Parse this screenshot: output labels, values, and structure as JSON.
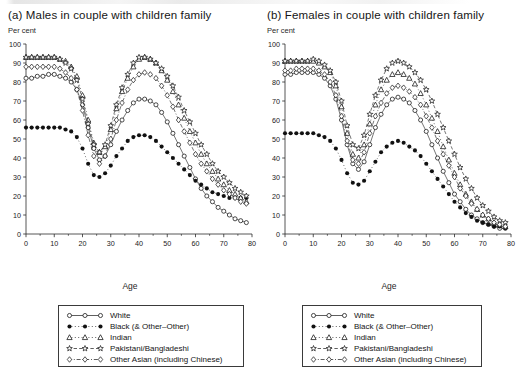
{
  "panels": [
    {
      "key": "a",
      "title": "(a) Males in couple with children family",
      "axis_unit": "Per cent",
      "xlabel": "Age"
    },
    {
      "key": "b",
      "title": "(b) Females in couple with children family",
      "axis_unit": "Per cent",
      "xlabel": "Age"
    }
  ],
  "legend": {
    "items": [
      {
        "label": "White",
        "marker": "open-circle",
        "line": "solid",
        "color": "#1a1a1a"
      },
      {
        "label": "Black (& Other–Other)",
        "marker": "filled-circle",
        "line": "dotted",
        "color": "#000000"
      },
      {
        "label": "Indian",
        "marker": "open-triangle",
        "line": "dotted",
        "color": "#1a1a1a"
      },
      {
        "label": "Pakistani/Bangladeshi",
        "marker": "open-star",
        "line": "dashed",
        "color": "#1a1a1a"
      },
      {
        "label": "Other Asian (including Chinese)",
        "marker": "open-diamond",
        "line": "dashdot",
        "color": "#1a1a1a"
      }
    ]
  },
  "chart_data": [
    {
      "type": "line",
      "panel": "a",
      "title": "(a) Males in couple with children family",
      "xlabel": "Age",
      "ylabel": "Per cent",
      "xlim": [
        0,
        80
      ],
      "ylim": [
        0,
        100
      ],
      "xticks": [
        0,
        10,
        20,
        30,
        40,
        50,
        60,
        70,
        80
      ],
      "yticks": [
        0,
        10,
        20,
        30,
        40,
        50,
        60,
        70,
        80,
        90,
        100
      ],
      "x_minor_step": 5,
      "grid": false,
      "legend_position": "below",
      "x": [
        0,
        2,
        4,
        6,
        8,
        10,
        12,
        14,
        16,
        18,
        20,
        22,
        24,
        26,
        28,
        30,
        32,
        34,
        36,
        38,
        40,
        42,
        44,
        46,
        48,
        50,
        52,
        54,
        56,
        58,
        60,
        62,
        64,
        66,
        68,
        70,
        72,
        74,
        76,
        78
      ],
      "series": [
        {
          "name": "White",
          "marker": "open-circle",
          "line": "solid",
          "values": [
            82,
            82,
            83,
            83,
            84,
            84,
            83,
            82,
            80,
            76,
            68,
            56,
            45,
            39,
            41,
            47,
            54,
            60,
            65,
            69,
            71,
            71,
            70,
            68,
            64,
            59,
            53,
            47,
            41,
            35,
            29,
            24,
            20,
            17,
            14,
            12,
            10,
            8,
            7,
            6
          ]
        },
        {
          "name": "Black (& Other–Other)",
          "marker": "filled-circle",
          "line": "dotted",
          "values": [
            56,
            56,
            56,
            56,
            56,
            56,
            56,
            55,
            54,
            51,
            45,
            37,
            31,
            30,
            32,
            36,
            41,
            45,
            49,
            51,
            52,
            52,
            51,
            49,
            46,
            43,
            40,
            37,
            34,
            31,
            28,
            26,
            24,
            22,
            21,
            20,
            19,
            19,
            19,
            19
          ]
        },
        {
          "name": "Indian",
          "marker": "open-triangle",
          "line": "dotted",
          "values": [
            93,
            93,
            93,
            93,
            93,
            93,
            92,
            91,
            88,
            83,
            73,
            60,
            48,
            43,
            46,
            55,
            66,
            75,
            82,
            88,
            92,
            93,
            92,
            90,
            86,
            81,
            75,
            68,
            61,
            54,
            48,
            42,
            37,
            33,
            29,
            26,
            23,
            21,
            19,
            17
          ]
        },
        {
          "name": "Pakistani/Bangladeshi",
          "marker": "open-star",
          "line": "dashed",
          "values": [
            93,
            93,
            93,
            93,
            93,
            93,
            92,
            90,
            87,
            81,
            71,
            58,
            47,
            43,
            47,
            57,
            68,
            77,
            84,
            90,
            93,
            93,
            92,
            90,
            87,
            83,
            78,
            72,
            65,
            59,
            53,
            47,
            42,
            37,
            33,
            30,
            27,
            24,
            22,
            20
          ]
        },
        {
          "name": "Other Asian (including Chinese)",
          "marker": "open-diamond",
          "line": "dashdot",
          "values": [
            88,
            88,
            88,
            88,
            88,
            88,
            87,
            85,
            82,
            76,
            65,
            52,
            41,
            37,
            41,
            50,
            60,
            69,
            76,
            81,
            84,
            85,
            84,
            82,
            78,
            73,
            67,
            60,
            54,
            48,
            42,
            37,
            33,
            29,
            26,
            23,
            21,
            19,
            17,
            16
          ]
        }
      ]
    },
    {
      "type": "line",
      "panel": "b",
      "title": "(b) Females in couple with children family",
      "xlabel": "Age",
      "ylabel": "Per cent",
      "xlim": [
        0,
        80
      ],
      "ylim": [
        0,
        100
      ],
      "xticks": [
        0,
        10,
        20,
        30,
        40,
        50,
        60,
        70,
        80
      ],
      "yticks": [
        0,
        10,
        20,
        30,
        40,
        50,
        60,
        70,
        80,
        90,
        100
      ],
      "x_minor_step": 5,
      "grid": false,
      "legend_position": "below",
      "x": [
        0,
        2,
        4,
        6,
        8,
        10,
        12,
        14,
        16,
        18,
        20,
        22,
        24,
        26,
        28,
        30,
        32,
        34,
        36,
        38,
        40,
        42,
        44,
        46,
        48,
        50,
        52,
        54,
        56,
        58,
        60,
        62,
        64,
        66,
        68,
        70,
        72,
        74,
        76,
        78
      ],
      "series": [
        {
          "name": "White",
          "marker": "open-circle",
          "line": "solid",
          "values": [
            84,
            84,
            85,
            85,
            85,
            85,
            84,
            82,
            78,
            71,
            60,
            47,
            37,
            34,
            38,
            47,
            56,
            63,
            68,
            71,
            72,
            71,
            69,
            65,
            60,
            54,
            47,
            40,
            33,
            27,
            21,
            17,
            13,
            10,
            8,
            6,
            5,
            4,
            3,
            3
          ]
        },
        {
          "name": "Black (& Other–Other)",
          "marker": "filled-circle",
          "line": "dotted",
          "values": [
            53,
            53,
            53,
            53,
            53,
            53,
            52,
            51,
            49,
            45,
            39,
            32,
            27,
            26,
            28,
            33,
            38,
            43,
            46,
            48,
            49,
            48,
            46,
            44,
            41,
            37,
            33,
            29,
            25,
            21,
            17,
            14,
            11,
            9,
            7,
            6,
            5,
            4,
            4,
            3
          ]
        },
        {
          "name": "Indian",
          "marker": "open-triangle",
          "line": "dotted",
          "values": [
            91,
            91,
            91,
            91,
            91,
            91,
            90,
            88,
            85,
            78,
            67,
            53,
            42,
            40,
            47,
            58,
            68,
            76,
            81,
            84,
            85,
            84,
            82,
            79,
            74,
            68,
            61,
            54,
            46,
            39,
            32,
            26,
            21,
            17,
            13,
            10,
            8,
            6,
            5,
            4
          ]
        },
        {
          "name": "Pakistani/Bangladeshi",
          "marker": "open-star",
          "line": "dashed",
          "values": [
            91,
            91,
            91,
            91,
            91,
            92,
            91,
            89,
            86,
            80,
            70,
            57,
            47,
            45,
            52,
            63,
            73,
            81,
            87,
            90,
            91,
            90,
            88,
            85,
            81,
            76,
            70,
            63,
            56,
            49,
            42,
            35,
            29,
            24,
            19,
            15,
            12,
            9,
            7,
            6
          ]
        },
        {
          "name": "Other Asian (including Chinese)",
          "marker": "open-diamond",
          "line": "dashdot",
          "values": [
            86,
            86,
            87,
            87,
            87,
            87,
            86,
            84,
            80,
            73,
            62,
            49,
            39,
            37,
            43,
            53,
            62,
            69,
            74,
            77,
            78,
            77,
            75,
            72,
            68,
            62,
            56,
            49,
            42,
            36,
            30,
            24,
            20,
            16,
            13,
            10,
            8,
            6,
            5,
            4
          ]
        }
      ]
    }
  ]
}
